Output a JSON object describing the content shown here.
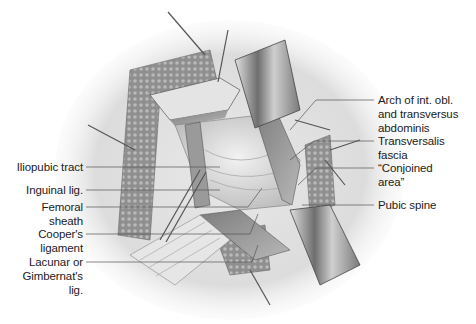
{
  "figure": {
    "colors": {
      "background": "#ffffff",
      "skin_shadow": "#d4d4d4",
      "fat_texture": "#9a9a9a",
      "retractor_blade": "#8c8c8c",
      "leader_line": "#555555",
      "label_text": "#1c1c1c"
    }
  },
  "labels_left": [
    {
      "id": "iliopubic-tract",
      "lines": [
        "Iliopubic tract"
      ]
    },
    {
      "id": "inguinal-lig",
      "lines": [
        "Inguinal lig."
      ]
    },
    {
      "id": "femoral-sheath",
      "lines": [
        "Femoral",
        "sheath"
      ]
    },
    {
      "id": "coopers-ligament",
      "lines": [
        "Cooper's",
        "ligament"
      ]
    },
    {
      "id": "lacunar-lig",
      "lines": [
        "Lacunar or",
        "Gimbernat's",
        "lig."
      ]
    }
  ],
  "labels_right": [
    {
      "id": "arch-int-obl",
      "lines": [
        "Arch of int. obl.",
        "and transversus",
        "abdominis"
      ]
    },
    {
      "id": "transversalis-fascia",
      "lines": [
        "Transversalis",
        "fascia"
      ]
    },
    {
      "id": "conjoined-area",
      "lines": [
        "“Conjoined",
        "area”"
      ]
    },
    {
      "id": "pubic-spine",
      "lines": [
        "Pubic spine"
      ]
    }
  ]
}
